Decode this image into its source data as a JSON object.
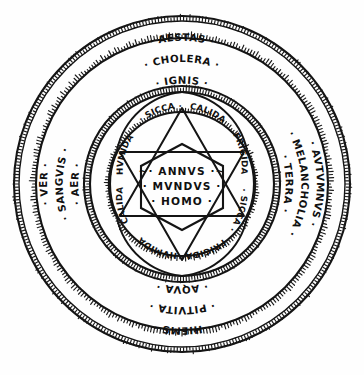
{
  "diagram": {
    "background_color": "#fefefe",
    "ink_color": "#141414"
  },
  "outer_ring": {
    "name": "seasons-humours-elements-ring",
    "groups": [
      {
        "position": "top",
        "season": "· AESTAS ·",
        "humour": "· CHOLERA ·",
        "element": "· IGNIS ·"
      },
      {
        "position": "right",
        "season": "· AVTVMNVS ·",
        "humour": "· MELANCHOLIA ·",
        "element": "· TERRA ·"
      },
      {
        "position": "bottom",
        "season": "· HIEMS ·",
        "humour": "· PITVITA ·",
        "element": "· AQVA ·"
      },
      {
        "position": "left",
        "season": "· VER ·",
        "humour": "· SANGVIS ·",
        "element": "· AER ·"
      }
    ]
  },
  "inner_ring": {
    "name": "qualities-ring",
    "segments": [
      {
        "index": 0,
        "label": "· SICCA ·",
        "angle": -70
      },
      {
        "index": 1,
        "label": "· CALIDA ·",
        "angle": -25
      },
      {
        "index": 2,
        "label": "· FRIGIDA ·",
        "angle": 25
      },
      {
        "index": 3,
        "label": "· SICCA ·",
        "angle": 70
      },
      {
        "index": 4,
        "label": "· FRIGIDA ·",
        "angle": 115
      },
      {
        "index": 5,
        "label": "· HVMIDA ·",
        "angle": 155
      },
      {
        "index": 6,
        "label": "· CALIDA ·",
        "angle": 205
      },
      {
        "index": 7,
        "label": "· HVMIDA ·",
        "angle": 250
      }
    ]
  },
  "core": {
    "name": "central-hexagon",
    "lines": [
      "~· ANNVS ·~",
      "· MVNDVS ·",
      "· HOMO ·"
    ]
  }
}
